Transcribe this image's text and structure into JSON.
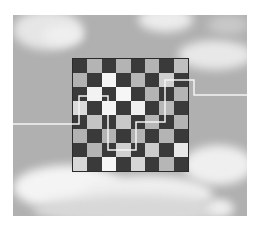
{
  "scene": {
    "description": "8x8 checkerboard floating over a cloudy sky, with a white line path threading through the board",
    "colors": {
      "page_background": "#ffffff",
      "sky": "#b0b0b0",
      "cloud": "#f2f2f2",
      "dark_square": "#3a3a3a",
      "board_border": "#2a2a2a",
      "path_line": "#f4f4f4"
    },
    "photo": {
      "x": 13,
      "y": 15,
      "width": 234,
      "height": 201
    },
    "clouds": [
      {
        "x": 0,
        "y": -5,
        "w": 70,
        "h": 40,
        "color": "#e6e6e6"
      },
      {
        "x": 30,
        "y": 10,
        "w": 40,
        "h": 20,
        "color": "#efefef"
      },
      {
        "x": 125,
        "y": -8,
        "w": 55,
        "h": 25,
        "color": "#ececec"
      },
      {
        "x": 165,
        "y": 25,
        "w": 75,
        "h": 30,
        "color": "#e8e8e8"
      },
      {
        "x": 195,
        "y": 0,
        "w": 40,
        "h": 20,
        "color": "#c8c8c8"
      },
      {
        "x": 0,
        "y": 150,
        "w": 110,
        "h": 45,
        "color": "#f4f4f4"
      },
      {
        "x": 70,
        "y": 160,
        "w": 130,
        "h": 40,
        "color": "#eeeeee"
      },
      {
        "x": 170,
        "y": 130,
        "w": 70,
        "h": 40,
        "color": "#efefef"
      },
      {
        "x": 20,
        "y": 180,
        "w": 200,
        "h": 30,
        "color": "#d8d8d8"
      },
      {
        "x": 195,
        "y": 185,
        "w": 25,
        "h": 15,
        "color": "#f0f0f0"
      }
    ],
    "board": {
      "x": 72,
      "y": 58,
      "width": 117,
      "height": 114,
      "rows": 8,
      "cols": 8,
      "top_left": "dark",
      "light_square_shades": [
        [
          "#b4b4b4",
          "#b4b4b4",
          "#b4b4b4",
          "#c0c0c0"
        ],
        [
          "#b2b2b2",
          "#f4f4f4",
          "#b6b6b6",
          "#d0d0d0"
        ],
        [
          "#f2f2f2",
          "#f6f6f6",
          "#b4b4b4",
          "#b4b4b4"
        ],
        [
          "#dadada",
          "#f4f4f4",
          "#f0f0f0",
          "#b8b8b8"
        ],
        [
          "#c4c4c4",
          "#c8c8c8",
          "#b6b6b6",
          "#b4b4b4"
        ],
        [
          "#b2b2b2",
          "#b4b4b4",
          "#b4b4b4",
          "#b4b4b4"
        ],
        [
          "#b4b4b4",
          "#d0d0d0",
          "#cccccc",
          "#e8e8e8"
        ],
        [
          "#d8d8d8",
          "#f6f6f6",
          "#d6d6d6",
          "#b6b6b6"
        ]
      ]
    },
    "path_points": [
      [
        13,
        124
      ],
      [
        79,
        124
      ],
      [
        79,
        96
      ],
      [
        108,
        96
      ],
      [
        108,
        150
      ],
      [
        136,
        150
      ],
      [
        136,
        122
      ],
      [
        165,
        122
      ],
      [
        165,
        80
      ],
      [
        194,
        80
      ],
      [
        194,
        95
      ],
      [
        247,
        95
      ]
    ]
  }
}
